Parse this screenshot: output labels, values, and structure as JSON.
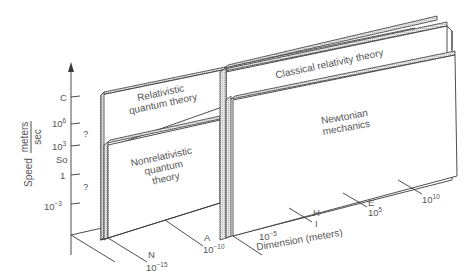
{
  "diagram": {
    "type": "3d-block-diagram",
    "y_axis": {
      "label": "Speed",
      "unit_numerator": "meters",
      "unit_denominator": "sec",
      "ticks": [
        {
          "label": "C",
          "base": "C",
          "exp": ""
        },
        {
          "label": "10^6",
          "base": "10",
          "exp": "6"
        },
        {
          "label": "10^3",
          "base": "10",
          "exp": "3"
        },
        {
          "label": "So",
          "base": "So",
          "exp": ""
        },
        {
          "label": "1",
          "base": "1",
          "exp": ""
        },
        {
          "label": "10^-3",
          "base": "10",
          "exp": "−3"
        }
      ],
      "question_marks": [
        "?",
        "?"
      ]
    },
    "x_axis": {
      "label": "Dimension (meters)",
      "ticks": [
        {
          "letter": "N",
          "base": "10",
          "exp": "−15"
        },
        {
          "letter": "A",
          "base": "10",
          "exp": "−10"
        },
        {
          "letter": "",
          "base": "10",
          "exp": "−5"
        },
        {
          "letter": "H",
          "sub_letter": "I",
          "base": "",
          "exp": ""
        },
        {
          "letter": "E",
          "base": "10",
          "exp": "5"
        },
        {
          "letter": "",
          "base": "10",
          "exp": "10"
        }
      ]
    },
    "regions": {
      "relativistic_quantum": {
        "line1": "Relativistic",
        "line2": "quantum theory"
      },
      "classical_relativity": {
        "line1": "Classical relativity theory"
      },
      "nonrelativistic_quantum": {
        "line1": "Nonrelativistic",
        "line2": "quantum",
        "line3": "theory"
      },
      "newtonian": {
        "line1": "Newtonian",
        "line2": "mechanics"
      }
    }
  }
}
